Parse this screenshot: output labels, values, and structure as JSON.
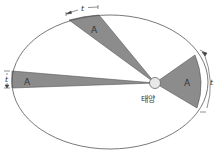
{
  "diagram": {
    "sun_label": "태양",
    "area_label": "A",
    "time_label": "t",
    "sectors": [
      {
        "name": "top-sector",
        "label": "A",
        "time": "t"
      },
      {
        "name": "left-sector",
        "label": "A",
        "time": "t"
      },
      {
        "name": "right-sector",
        "label": "A",
        "time": "t"
      }
    ],
    "colors": {
      "sector_fill": "#8c8c8c",
      "orbit_stroke": "#555555",
      "sun_fill": "#e8e8e8",
      "sun_stroke": "#666666"
    }
  }
}
